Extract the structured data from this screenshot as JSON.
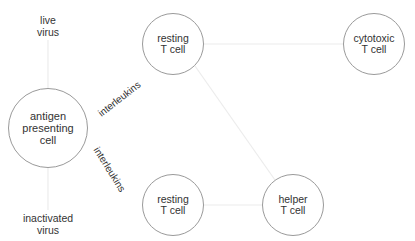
{
  "diagram": {
    "nodes": [
      {
        "id": "apc",
        "label": "antigen\npresenting\ncell",
        "cx": 48,
        "cy": 128,
        "r": 40
      },
      {
        "id": "resting_top",
        "label": "resting\nT cell",
        "cx": 173,
        "cy": 44,
        "r": 31
      },
      {
        "id": "cytotoxic",
        "label": "cytotoxic\nT cell",
        "cx": 374,
        "cy": 44,
        "r": 31
      },
      {
        "id": "resting_bottom",
        "label": "resting\nT cell",
        "cx": 173,
        "cy": 205,
        "r": 31
      },
      {
        "id": "helper",
        "label": "helper\nT cell",
        "cx": 293,
        "cy": 205,
        "r": 31
      }
    ],
    "free_labels": [
      {
        "id": "live_virus",
        "label": "live\nvirus",
        "x": 48,
        "y": 14
      },
      {
        "id": "inactivated_virus",
        "label": "inactivated\nvirus",
        "x": 48,
        "y": 212
      }
    ],
    "edges": [
      {
        "from": "live_virus",
        "to": "apc",
        "label": ""
      },
      {
        "from": "inactivated_virus",
        "to": "apc",
        "label": ""
      },
      {
        "from": "apc",
        "to": "resting_top",
        "label": "interleukins"
      },
      {
        "from": "apc",
        "to": "resting_bottom",
        "label": "interleukins"
      },
      {
        "from": "resting_top",
        "to": "cytotoxic",
        "label": ""
      },
      {
        "from": "resting_top",
        "to": "helper",
        "label": ""
      },
      {
        "from": "resting_bottom",
        "to": "helper",
        "label": ""
      }
    ],
    "colors": {
      "node_border": "#9a9a9a",
      "edge": "#ececec",
      "text": "#333333"
    }
  }
}
